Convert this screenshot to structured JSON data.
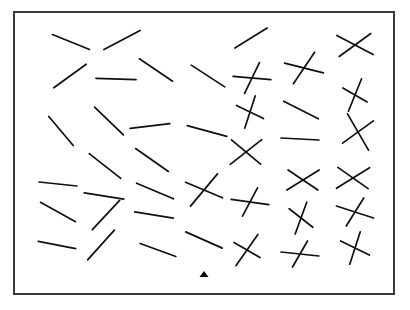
{
  "scene": {
    "title": "Oriented line segment visual search array",
    "canvas_width": 410,
    "canvas_height": 310,
    "background_color": "#ffffff",
    "ink_color": "#101010"
  },
  "frame": {
    "name": "stimulus-border",
    "x": 13,
    "y": 11,
    "width": 382,
    "height": 284,
    "border_width": 2,
    "border_color": "#3a3a3a",
    "fill_color": "#ffffff"
  },
  "stroke_width": 1.7,
  "fixation": {
    "label": "fixation-triangle",
    "x": 204,
    "y": 274,
    "half_width": 4.5,
    "height": 6,
    "color": "#0b0b0b"
  },
  "items": [
    {
      "id": "r1c1",
      "type": "line",
      "cx": 71,
      "cy": 42,
      "segments": [
        {
          "angle": 22,
          "length": 40
        }
      ]
    },
    {
      "id": "r1c2",
      "type": "line",
      "cx": 122,
      "cy": 40,
      "segments": [
        {
          "angle": -28,
          "length": 41
        }
      ]
    },
    {
      "id": "r1c4",
      "type": "line",
      "cx": 251,
      "cy": 38,
      "segments": [
        {
          "angle": -32,
          "length": 38
        }
      ]
    },
    {
      "id": "r1c6",
      "type": "cross",
      "cx": 355,
      "cy": 45,
      "segments": [
        {
          "angle": 28,
          "length": 41
        },
        {
          "angle": -36,
          "length": 39
        }
      ]
    },
    {
      "id": "r2c1",
      "type": "line",
      "cx": 70,
      "cy": 76,
      "segments": [
        {
          "angle": -36,
          "length": 40
        }
      ]
    },
    {
      "id": "r2c2",
      "type": "line",
      "cx": 116,
      "cy": 79,
      "segments": [
        {
          "angle": 2,
          "length": 40
        }
      ]
    },
    {
      "id": "r2c3",
      "type": "line",
      "cx": 156,
      "cy": 70,
      "segments": [
        {
          "angle": 34,
          "length": 40
        }
      ]
    },
    {
      "id": "r2c4",
      "type": "line",
      "cx": 208,
      "cy": 76,
      "segments": [
        {
          "angle": 33,
          "length": 40
        }
      ]
    },
    {
      "id": "r2c5",
      "type": "cross",
      "cx": 252,
      "cy": 78,
      "segments": [
        {
          "angle": 5,
          "length": 38
        },
        {
          "angle": -64,
          "length": 34
        }
      ]
    },
    {
      "id": "r2c6",
      "type": "cross",
      "cx": 304,
      "cy": 68,
      "segments": [
        {
          "angle": 14,
          "length": 40
        },
        {
          "angle": -56,
          "length": 38
        }
      ]
    },
    {
      "id": "r2c7",
      "type": "cross",
      "cx": 355,
      "cy": 95,
      "segments": [
        {
          "angle": -68,
          "length": 35
        },
        {
          "angle": 30,
          "length": 28
        }
      ]
    },
    {
      "id": "r3c1",
      "type": "line",
      "cx": 61,
      "cy": 131,
      "segments": [
        {
          "angle": 50,
          "length": 38
        }
      ]
    },
    {
      "id": "r3c2",
      "type": "line",
      "cx": 109,
      "cy": 121,
      "segments": [
        {
          "angle": 44,
          "length": 40
        }
      ]
    },
    {
      "id": "r3c3",
      "type": "line",
      "cx": 150,
      "cy": 126,
      "segments": [
        {
          "angle": -7,
          "length": 40
        }
      ]
    },
    {
      "id": "r3c4",
      "type": "line",
      "cx": 207,
      "cy": 131,
      "segments": [
        {
          "angle": 15,
          "length": 41
        }
      ]
    },
    {
      "id": "r3c5",
      "type": "cross",
      "cx": 250,
      "cy": 112,
      "segments": [
        {
          "angle": -72,
          "length": 34
        },
        {
          "angle": 26,
          "length": 30
        }
      ]
    },
    {
      "id": "r3c6",
      "type": "line",
      "cx": 301,
      "cy": 110,
      "segments": [
        {
          "angle": 27,
          "length": 39
        }
      ]
    },
    {
      "id": "r3c7",
      "type": "cross",
      "cx": 358,
      "cy": 132,
      "segments": [
        {
          "angle": 60,
          "length": 42
        },
        {
          "angle": -36,
          "length": 38
        }
      ]
    },
    {
      "id": "r4c2",
      "type": "line",
      "cx": 105,
      "cy": 166,
      "segments": [
        {
          "angle": 38,
          "length": 40
        }
      ]
    },
    {
      "id": "r4c3",
      "type": "line",
      "cx": 152,
      "cy": 160,
      "segments": [
        {
          "angle": 35,
          "length": 40
        }
      ]
    },
    {
      "id": "r4c5",
      "type": "cross",
      "cx": 246,
      "cy": 152,
      "segments": [
        {
          "angle": -38,
          "length": 40
        },
        {
          "angle": 40,
          "length": 38
        }
      ]
    },
    {
      "id": "r4c6",
      "type": "line",
      "cx": 300,
      "cy": 139,
      "segments": [
        {
          "angle": 3,
          "length": 38
        }
      ]
    },
    {
      "id": "r5c1",
      "type": "line",
      "cx": 58,
      "cy": 184,
      "segments": [
        {
          "angle": 6,
          "length": 38
        }
      ]
    },
    {
      "id": "r5c2",
      "type": "line",
      "cx": 104,
      "cy": 196,
      "segments": [
        {
          "angle": 9,
          "length": 40
        }
      ]
    },
    {
      "id": "r5c3",
      "type": "line",
      "cx": 155,
      "cy": 191,
      "segments": [
        {
          "angle": 23,
          "length": 40
        }
      ]
    },
    {
      "id": "r5c4",
      "type": "cross",
      "cx": 204,
      "cy": 190,
      "segments": [
        {
          "angle": -50,
          "length": 42
        },
        {
          "angle": 23,
          "length": 40
        }
      ]
    },
    {
      "id": "r5c5",
      "type": "cross",
      "cx": 250,
      "cy": 202,
      "segments": [
        {
          "angle": 8,
          "length": 38
        },
        {
          "angle": -62,
          "length": 32
        }
      ]
    },
    {
      "id": "r5c6",
      "type": "cross",
      "cx": 303,
      "cy": 180,
      "segments": [
        {
          "angle": -32,
          "length": 38
        },
        {
          "angle": 34,
          "length": 36
        }
      ]
    },
    {
      "id": "r5c7",
      "type": "cross",
      "cx": 353,
      "cy": 178,
      "segments": [
        {
          "angle": -32,
          "length": 39
        },
        {
          "angle": 35,
          "length": 37
        }
      ]
    },
    {
      "id": "r6c1",
      "type": "line",
      "cx": 58,
      "cy": 212,
      "segments": [
        {
          "angle": 29,
          "length": 40
        }
      ]
    },
    {
      "id": "r6c2",
      "type": "line",
      "cx": 106,
      "cy": 215,
      "segments": [
        {
          "angle": -47,
          "length": 40
        }
      ]
    },
    {
      "id": "r6c3",
      "type": "line",
      "cx": 154,
      "cy": 215,
      "segments": [
        {
          "angle": 9,
          "length": 39
        }
      ]
    },
    {
      "id": "r6c6",
      "type": "cross",
      "cx": 301,
      "cy": 218,
      "segments": [
        {
          "angle": -70,
          "length": 34
        },
        {
          "angle": 38,
          "length": 30
        }
      ]
    },
    {
      "id": "r6c7",
      "type": "cross",
      "cx": 355,
      "cy": 212,
      "segments": [
        {
          "angle": 18,
          "length": 39
        },
        {
          "angle": -58,
          "length": 33
        }
      ]
    },
    {
      "id": "r7c1",
      "type": "line",
      "cx": 57,
      "cy": 245,
      "segments": [
        {
          "angle": 11,
          "length": 38
        }
      ]
    },
    {
      "id": "r7c2",
      "type": "line",
      "cx": 101,
      "cy": 245,
      "segments": [
        {
          "angle": -48,
          "length": 40
        }
      ]
    },
    {
      "id": "r7c3",
      "type": "line",
      "cx": 158,
      "cy": 250,
      "segments": [
        {
          "angle": 20,
          "length": 38
        }
      ]
    },
    {
      "id": "r7c4",
      "type": "line",
      "cx": 204,
      "cy": 240,
      "segments": [
        {
          "angle": 24,
          "length": 40
        }
      ]
    },
    {
      "id": "r7c5",
      "type": "cross",
      "cx": 247,
      "cy": 250,
      "segments": [
        {
          "angle": -55,
          "length": 38
        },
        {
          "angle": 30,
          "length": 30
        }
      ]
    },
    {
      "id": "r7c6",
      "type": "cross",
      "cx": 300,
      "cy": 254,
      "segments": [
        {
          "angle": 6,
          "length": 38
        },
        {
          "angle": -60,
          "length": 30
        }
      ]
    },
    {
      "id": "r7c7",
      "type": "cross",
      "cx": 355,
      "cy": 248,
      "segments": [
        {
          "angle": -72,
          "length": 34
        },
        {
          "angle": 26,
          "length": 32
        }
      ]
    }
  ]
}
